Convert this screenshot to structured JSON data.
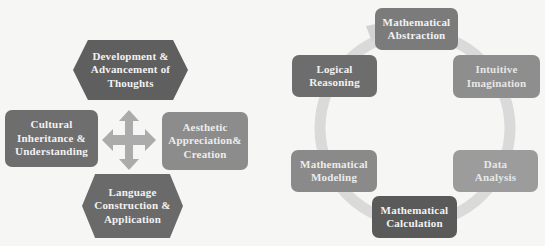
{
  "left_diagram": {
    "top": {
      "label": "Development & Advancement of Thoughts",
      "lines": [
        "Development &",
        "Advancement of",
        "Thoughts"
      ],
      "color": "#5f5f5f"
    },
    "left": {
      "label": "Cultural Inheritance & Understanding",
      "lines": [
        "Cultural",
        "Inheritance &",
        "Understanding"
      ],
      "color": "#6e6e6e"
    },
    "right": {
      "label": "Aesthetic Appreciation& Creation",
      "lines": [
        "Aesthetic",
        "Appreciation&",
        "Creation"
      ],
      "color": "#8c8c8c"
    },
    "bottom": {
      "label": "Language Construction & Application",
      "lines": [
        "Language",
        "Construction &",
        "Application"
      ],
      "color": "#6a6a6a"
    },
    "center_icon": "four-way-arrow-icon",
    "arrow_color": "#ababab"
  },
  "right_diagram": {
    "ring_color": "#dadada",
    "nodes": [
      {
        "label": "Mathematical Abstraction",
        "lines": [
          "Mathematical",
          "Abstraction"
        ],
        "color": "#7b7b7b"
      },
      {
        "label": "Intuitive Imagination",
        "lines": [
          "Intuitive",
          "Imagination"
        ],
        "color": "#8e8e8e"
      },
      {
        "label": "Data Analysis",
        "lines": [
          "Data",
          "Analysis"
        ],
        "color": "#9c9c9c"
      },
      {
        "label": "Mathematical Calculation",
        "lines": [
          "Mathematical",
          "Calculation"
        ],
        "color": "#5a5a5a"
      },
      {
        "label": "Mathematical Modeling",
        "lines": [
          "Mathematical",
          "Modeling"
        ],
        "color": "#8a8a8a"
      },
      {
        "label": "Logical Reasoning",
        "lines": [
          "Logical",
          "Reasoning"
        ],
        "color": "#6d6d6d"
      }
    ]
  }
}
